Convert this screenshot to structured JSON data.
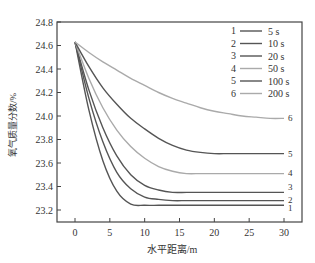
{
  "chart_data": {
    "type": "line",
    "title": "",
    "xlabel": "水平距离/m",
    "ylabel": "氧气质量分数/%",
    "xlim": [
      -3,
      32
    ],
    "ylim": [
      23.1,
      24.8
    ],
    "xticks": [
      0,
      5,
      10,
      15,
      20,
      25,
      30
    ],
    "yticks": [
      23.2,
      23.4,
      23.6,
      23.8,
      24.0,
      24.2,
      24.4,
      24.6,
      24.8
    ],
    "grid": false,
    "legend_position": "upper right",
    "x": [
      0,
      2,
      4,
      6,
      8,
      10,
      12,
      14,
      16,
      18,
      20,
      22,
      24,
      26,
      28,
      30
    ],
    "series": [
      {
        "id": "1",
        "name": "5 s",
        "color": "#555555",
        "end_label": "1",
        "values": [
          24.63,
          24.05,
          23.62,
          23.36,
          23.25,
          23.24,
          23.24,
          23.24,
          23.24,
          23.24,
          23.24,
          23.24,
          23.24,
          23.24,
          23.24,
          23.24
        ]
      },
      {
        "id": "2",
        "name": "10 s",
        "color": "#555555",
        "end_label": "2",
        "values": [
          24.63,
          24.15,
          23.78,
          23.52,
          23.38,
          23.31,
          23.29,
          23.28,
          23.28,
          23.28,
          23.28,
          23.28,
          23.28,
          23.28,
          23.28,
          23.28
        ]
      },
      {
        "id": "3",
        "name": "20 s",
        "color": "#555555",
        "end_label": "3",
        "values": [
          24.63,
          24.22,
          23.9,
          23.66,
          23.5,
          23.41,
          23.37,
          23.35,
          23.35,
          23.35,
          23.35,
          23.35,
          23.35,
          23.35,
          23.35,
          23.35
        ]
      },
      {
        "id": "4",
        "name": "50 s",
        "color": "#aaaaaa",
        "end_label": "4",
        "values": [
          24.63,
          24.32,
          24.07,
          23.88,
          23.74,
          23.64,
          23.57,
          23.53,
          23.51,
          23.51,
          23.51,
          23.51,
          23.51,
          23.51,
          23.51,
          23.51
        ]
      },
      {
        "id": "5",
        "name": "100 s",
        "color": "#555555",
        "end_label": "5",
        "values": [
          24.63,
          24.42,
          24.24,
          24.1,
          23.98,
          23.89,
          23.81,
          23.75,
          23.71,
          23.69,
          23.68,
          23.68,
          23.68,
          23.68,
          23.68,
          23.68
        ]
      },
      {
        "id": "6",
        "name": "200 s",
        "color": "#aaaaaa",
        "end_label": "6",
        "values": [
          24.63,
          24.54,
          24.46,
          24.39,
          24.32,
          24.26,
          24.2,
          24.15,
          24.11,
          24.07,
          24.04,
          24.02,
          24.0,
          23.99,
          23.98,
          23.98
        ]
      }
    ]
  }
}
